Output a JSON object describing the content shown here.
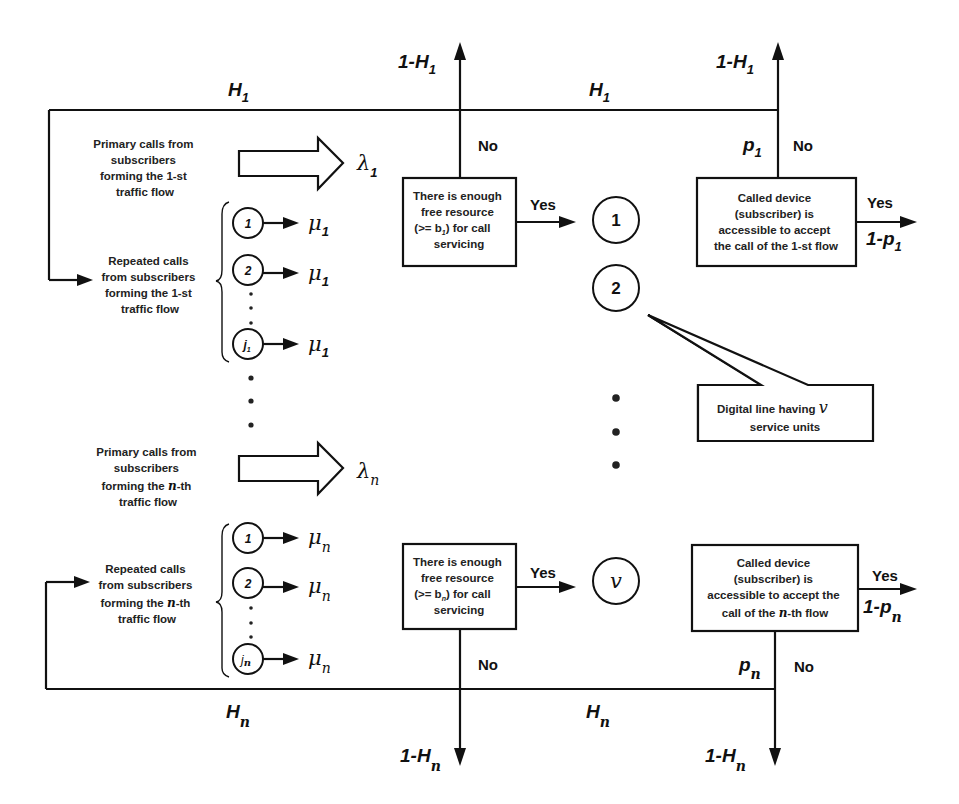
{
  "diagram": {
    "loops": {
      "top": {
        "label_left": "H",
        "label_right": "H",
        "sub": "1"
      },
      "bottom": {
        "label_left": "H",
        "label_right": "H",
        "sub": "n"
      }
    },
    "exits": {
      "top_left": {
        "text": "1-H",
        "sub": "1"
      },
      "top_right": {
        "text": "1-H",
        "sub": "1"
      },
      "bottom_left": {
        "text": "1-H",
        "sub": "n"
      },
      "bottom_right": {
        "text": "1-H",
        "sub": "n"
      }
    },
    "flow1": {
      "primary_label": [
        "Primary calls from",
        "subscribers",
        "forming the 1-st",
        "traffic flow"
      ],
      "primary_rate": {
        "symbol": "λ",
        "sub": "1"
      },
      "repeated_label": [
        "Repeated calls",
        "from subscribers",
        "forming the 1-st",
        "traffic flow"
      ],
      "sources": [
        {
          "id": "1",
          "rate_symbol": "μ",
          "rate_sub": "1"
        },
        {
          "id": "2",
          "rate_symbol": "μ",
          "rate_sub": "1"
        },
        {
          "id": "j",
          "id_sub": "1",
          "rate_symbol": "μ",
          "rate_sub": "1"
        }
      ],
      "resource_box": [
        "There is enough",
        "free resource",
        "(>= b",
        ") for call",
        "servicing"
      ],
      "resource_box_sub": "1",
      "resource_no": "No",
      "resource_yes": "Yes",
      "called_box": [
        "Called device",
        "(subscriber) is",
        "accessible to accept",
        "the call of the 1-st flow"
      ],
      "called_yes": "Yes",
      "called_no": "No",
      "p_label": {
        "text": "p",
        "sub": "1"
      },
      "accept_label": {
        "text": "1-p",
        "sub": "1"
      }
    },
    "flowN": {
      "primary_label": [
        "Primary calls from",
        "subscribers",
        "forming the ",
        "-th",
        "traffic flow"
      ],
      "primary_label_n": "n",
      "primary_rate": {
        "symbol": "λ",
        "sub": "n"
      },
      "repeated_label": [
        "Repeated calls",
        "from subscribers",
        "forming the ",
        "-th",
        "traffic flow"
      ],
      "repeated_label_n": "n",
      "sources": [
        {
          "id": "1",
          "rate_symbol": "μ",
          "rate_sub": "n"
        },
        {
          "id": "2",
          "rate_symbol": "μ",
          "rate_sub": "n"
        },
        {
          "id": "j",
          "id_sub": "n",
          "rate_symbol": "μ",
          "rate_sub": "n"
        }
      ],
      "resource_box": [
        "There is enough",
        "free resource",
        "(>= b",
        ") for call",
        "servicing"
      ],
      "resource_box_sub": "n",
      "resource_no": "No",
      "resource_yes": "Yes",
      "called_box": [
        "Called device",
        "(subscriber) is",
        "accessible to accept the",
        "call of the ",
        "-th flow"
      ],
      "called_box_n": "n",
      "called_yes": "Yes",
      "called_no": "No",
      "p_label": {
        "text": "p",
        "sub": "n"
      },
      "accept_label": {
        "text": "1-p",
        "sub": "n"
      }
    },
    "service_units": {
      "units": [
        "1",
        "2",
        "v"
      ],
      "callout": [
        "Digital line having ",
        "service units"
      ],
      "callout_symbol": "v"
    }
  }
}
